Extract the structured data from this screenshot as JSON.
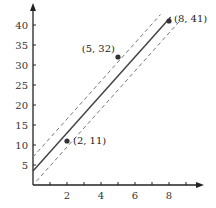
{
  "chart_data": {
    "type": "scatter",
    "title": "",
    "xlabel": "",
    "ylabel": "",
    "xlim": [
      0,
      10
    ],
    "ylim": [
      0,
      45
    ],
    "grid": false,
    "x_ticks": [
      1,
      2,
      3,
      4,
      5,
      6,
      7,
      8,
      9
    ],
    "x_tick_labels": [
      "",
      "2",
      "",
      "4",
      "",
      "6",
      "",
      "8",
      ""
    ],
    "y_ticks": [
      5,
      10,
      15,
      20,
      25,
      30,
      35,
      40
    ],
    "y_tick_labels": [
      "5",
      "10",
      "15",
      "20",
      "25",
      "30",
      "35",
      "40"
    ],
    "points": [
      {
        "x": 2,
        "y": 11,
        "label": "(2, 11)"
      },
      {
        "x": 5,
        "y": 32,
        "label": "(5, 32)"
      },
      {
        "x": 8,
        "y": 41,
        "label": "(8, 41)"
      }
    ],
    "lines": [
      {
        "name": "best-fit line",
        "style": "solid",
        "slope": 4.75,
        "intercept": 3.5,
        "x_range": [
          0,
          8.1
        ]
      },
      {
        "name": "upper bound",
        "style": "dashed",
        "slope": 4.75,
        "intercept": 7.0,
        "x_range": [
          0,
          7.5
        ]
      },
      {
        "name": "lower bound",
        "style": "dashed",
        "slope": 4.75,
        "intercept": 0.0,
        "x_range": [
          0.2,
          8.7
        ]
      }
    ]
  },
  "colors": {
    "axis": "#222222",
    "line": "#444444",
    "dashed": "#777777",
    "point": "#333333"
  }
}
